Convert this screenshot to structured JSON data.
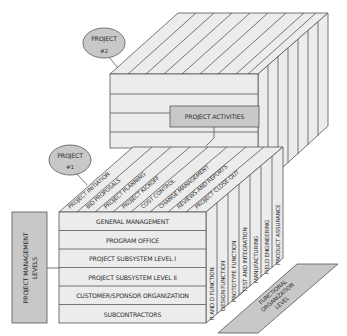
{
  "diagram": {
    "type": "3d-matrix-cube",
    "colors": {
      "face": "#ececec",
      "box": "#c8c8c8",
      "stroke": "#555555",
      "text": "#2c2c2c"
    },
    "projects": [
      {
        "label": "PROJECT",
        "number": "#2"
      },
      {
        "label": "PROJECT",
        "number": "#1"
      }
    ],
    "project_activities_label": "PROJECT ACTIVITIES",
    "management_levels_label": [
      "PROJECT MANAGEMENT",
      "LEVELS"
    ],
    "functional_level_label": [
      "FUNCTIONAL",
      "ORGANIZATION",
      "LEVEL"
    ],
    "management_levels": [
      "GENERAL MANAGEMENT",
      "PROGRAM OFFICE",
      "PROJECT SUBSYSTEM  LEVEL I",
      "PROJECT SUBSYSTEM  LEVEL II",
      "CUSTOMER/SPONSOR ORGANIZATION",
      "SUBCONTRACTORS"
    ],
    "activities": [
      "PROJECT INITIATION",
      "BID PROPOSALS",
      "PROJECT PLANNING",
      "PROJECT KICKOFF",
      "COST CONTROL",
      "CHANGE MANAGEMENT",
      "REVIEWS AND REPORTS",
      "PROJECT CLOSE-OUT"
    ],
    "functions": [
      "R AND D FUNCTION",
      "DESIGN FUNCTION",
      "PROTOTYPE FUNCTION",
      "TEST AND INTEGRATION",
      "MANUFACTURING",
      "FIELD ENGINEERING",
      "PRODUCT ASSURANCE"
    ]
  }
}
